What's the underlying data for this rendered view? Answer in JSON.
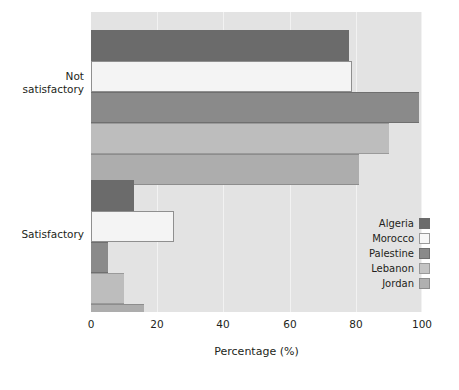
{
  "chart_data": {
    "type": "bar",
    "orientation": "horizontal",
    "title": "",
    "xlabel": "Percentage (%)",
    "ylabel": "",
    "xlim": [
      0,
      100
    ],
    "xticks": [
      0,
      20,
      40,
      60,
      80,
      100
    ],
    "grid": true,
    "legend_position": "center-right",
    "categories": [
      "Not satisfactory",
      "Satisfactory"
    ],
    "series": [
      {
        "name": "Algeria",
        "color": "#6b6b6b",
        "values": [
          78,
          13
        ]
      },
      {
        "name": "Morocco",
        "color": "#f4f4f4",
        "values": [
          79,
          25
        ]
      },
      {
        "name": "Palestine",
        "color": "#8a8a8a",
        "values": [
          99,
          5
        ]
      },
      {
        "name": "Lebanon",
        "color": "#bdbdbd",
        "values": [
          90,
          10
        ]
      },
      {
        "name": "Jordan",
        "color": "#adadad",
        "values": [
          81,
          16
        ]
      }
    ]
  },
  "axis": {
    "x_title": "Percentage (%)",
    "ticks": [
      {
        "label": "0"
      },
      {
        "label": "20"
      },
      {
        "label": "40"
      },
      {
        "label": "60"
      },
      {
        "label": "80"
      },
      {
        "label": "100"
      }
    ]
  },
  "categories": [
    {
      "label": "Not\nsatisfactory"
    },
    {
      "label": "Satisfactory"
    }
  ],
  "legend": {
    "items": [
      {
        "label": "Algeria"
      },
      {
        "label": "Morocco"
      },
      {
        "label": "Palestine"
      },
      {
        "label": "Lebanon"
      },
      {
        "label": "Jordan"
      }
    ]
  },
  "colors": {
    "plot_background": "#e3e3e3",
    "gridline": "#f2f2f2",
    "text": "#231f20",
    "algeria": "#6b6b6b",
    "morocco": "#f4f4f4",
    "palestine": "#8a8a8a",
    "lebanon": "#bdbdbd",
    "jordan": "#adadad"
  }
}
